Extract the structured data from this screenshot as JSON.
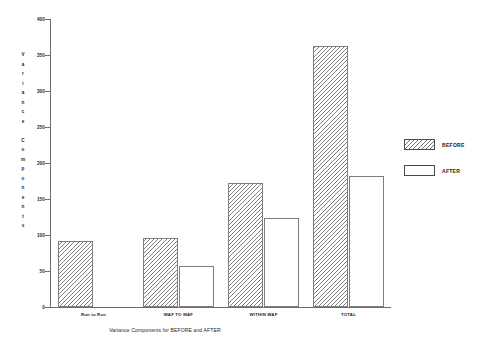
{
  "chart_data": {
    "type": "bar",
    "title": "Variance Components for BEFORE and AFTER",
    "xlabel": "",
    "ylabel": "Variance Components",
    "categories": [
      "Run to Run",
      "WAF TO WAF",
      "WITHIN WAF",
      "TOTAL"
    ],
    "series": [
      {
        "name": "BEFORE",
        "values": [
          92,
          96,
          172,
          362
        ]
      },
      {
        "name": "AFTER",
        "values": [
          null,
          57,
          124,
          182
        ]
      }
    ],
    "ylim": [
      0,
      400
    ],
    "ytick_labels": [
      "0",
      "50",
      "100",
      "150",
      "200",
      "250",
      "300",
      "350",
      "400"
    ],
    "ytick_values": [
      0,
      50,
      100,
      150,
      200,
      250,
      300,
      350,
      400
    ],
    "grid": false,
    "legend_position": "right",
    "legend": [
      {
        "label": "BEFORE",
        "fill": "hatched"
      },
      {
        "label": "AFTER",
        "fill": "empty"
      }
    ]
  },
  "axis": {
    "y_title_letters": [
      "V",
      "a",
      "r",
      "i",
      "a",
      "n",
      "c",
      "e",
      "",
      "C",
      "o",
      "m",
      "p",
      "o",
      "n",
      "e",
      "n",
      "t",
      "s"
    ]
  },
  "colors": {
    "background": "#ffffff",
    "axis": "#6d6d6d",
    "bar_outline": "#7d7d7d",
    "hatch": "#808080",
    "text": "#1d1d1d"
  }
}
